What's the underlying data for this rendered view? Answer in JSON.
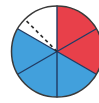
{
  "figure": {
    "name": "fraction-circle",
    "background_color": "#ffffff"
  },
  "chart_data": {
    "type": "pie",
    "title": "",
    "subtitle": "",
    "xlabel": "",
    "ylabel": "",
    "legend_position": "none",
    "grid": false,
    "total_sectors": 6,
    "sector_angle_degrees": 60,
    "start_angle_degrees": 90,
    "direction": "clockwise",
    "categories": [
      "Sector 1",
      "Sector 2",
      "Sector 3",
      "Sector 4",
      "Sector 5",
      "Sector 6"
    ],
    "values": [
      1,
      1,
      1,
      1,
      1,
      1
    ],
    "colors": [
      "#e8404a",
      "#e8404a",
      "#42a0dc",
      "#42a0dc",
      "#42a0dc",
      "#ffffff"
    ],
    "labels": [
      "",
      "",
      "",
      "",
      "",
      ""
    ],
    "annotations": [
      {
        "type": "dashed-radius",
        "from_angle_degrees": 90,
        "to_angle_degrees": 135,
        "color": "#2b2b2b",
        "style": "dashed"
      }
    ],
    "counts": {
      "red": 2,
      "blue": 3,
      "white": 1
    },
    "fractions": {
      "red": "2/6",
      "blue": "3/6",
      "white": "1/6"
    }
  },
  "geometry": {
    "center_x": 57,
    "center_y": 51.5,
    "radius": 45.5,
    "stroke_color": "#1f3a63",
    "outline_color": "#3a3a3a",
    "stroke_width": 1.4
  },
  "colors": {
    "red": "#e8404a",
    "blue": "#42a0dc",
    "white": "#ffffff",
    "outline": "#3a3a3a",
    "divider": "#1f3a63",
    "dash": "#2b2b2b"
  }
}
